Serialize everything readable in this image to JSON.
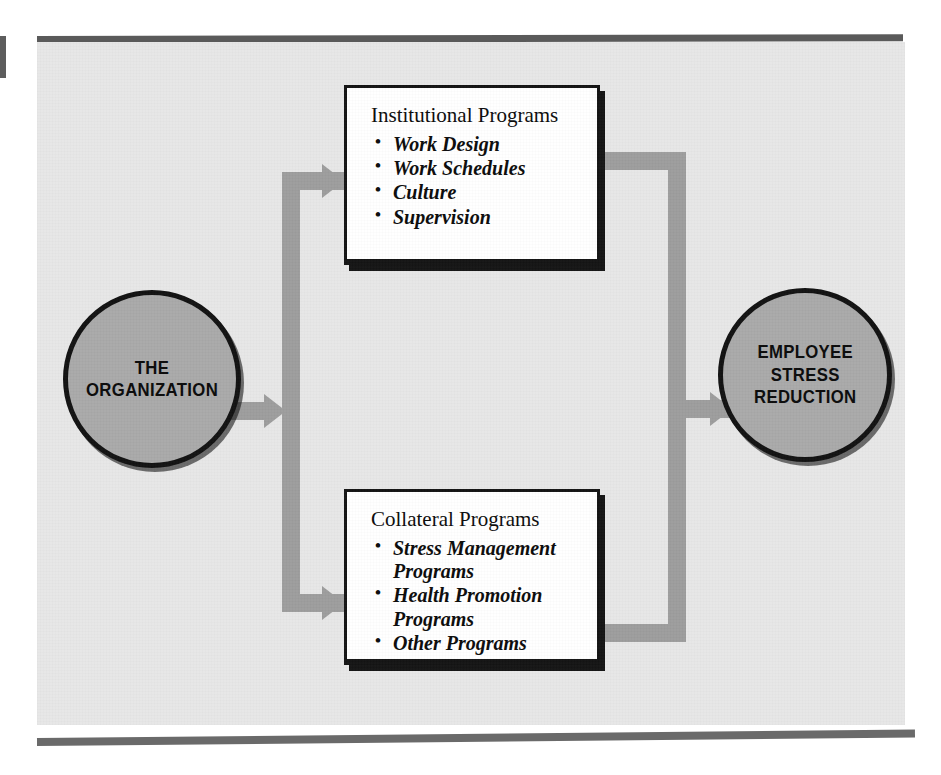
{
  "figure": {
    "colors": {
      "panel_background": "#e7e7e7",
      "connector_gray": "#9d9d9d",
      "circle_fill": "#a9a9a9",
      "box_fill": "#ffffff",
      "ink": "#111111"
    }
  },
  "source_node": {
    "name": "the-organization",
    "lines": [
      "THE",
      "ORGANIZATION"
    ]
  },
  "outcome_node": {
    "name": "employee-stress-reduction",
    "lines": [
      "EMPLOYEE",
      "STRESS",
      "REDUCTION"
    ]
  },
  "boxes": [
    {
      "id": "institutional-programs",
      "title": "Institutional Programs",
      "items": [
        {
          "text": "Work Design"
        },
        {
          "text": "Work Schedules"
        },
        {
          "text": "Culture"
        },
        {
          "text": "Supervision"
        }
      ]
    },
    {
      "id": "collateral-programs",
      "title": "Collateral Programs",
      "items": [
        {
          "text": "Stress Management",
          "continuation": "Programs"
        },
        {
          "text": "Health Promotion",
          "continuation": "Programs"
        },
        {
          "text": "Other Programs"
        }
      ]
    }
  ],
  "connectors": [
    {
      "name": "organization-to-split",
      "direction": "right"
    },
    {
      "name": "split-to-institutional-programs",
      "direction": "right"
    },
    {
      "name": "split-to-collateral-programs",
      "direction": "right"
    },
    {
      "name": "institutional-programs-to-merge",
      "direction": "right"
    },
    {
      "name": "collateral-programs-to-merge",
      "direction": "right"
    },
    {
      "name": "merge-to-employee-stress-reduction",
      "direction": "right"
    }
  ]
}
